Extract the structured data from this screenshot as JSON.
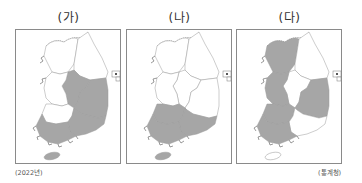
{
  "panels": [
    {
      "title": "(가)",
      "fills": {
        "gyeonggi": "#ffffff",
        "gangwon": "#ffffff",
        "chungbuk": "#a6a6a6",
        "chungnam": "#ffffff",
        "jeonbuk": "#ffffff",
        "jeonnam": "#a6a6a6",
        "gyeongbuk": "#a6a6a6",
        "gyeongnam": "#a6a6a6",
        "jeju": "#a6a6a6"
      }
    },
    {
      "title": "(나)",
      "fills": {
        "gyeonggi": "#ffffff",
        "gangwon": "#ffffff",
        "chungbuk": "#ffffff",
        "chungnam": "#ffffff",
        "jeonbuk": "#a6a6a6",
        "jeonnam": "#a6a6a6",
        "gyeongbuk": "#ffffff",
        "gyeongnam": "#a6a6a6",
        "jeju": "#a6a6a6"
      }
    },
    {
      "title": "(다)",
      "fills": {
        "gyeonggi": "#a6a6a6",
        "gangwon": "#ffffff",
        "chungbuk": "#ffffff",
        "chungnam": "#a6a6a6",
        "jeonbuk": "#a6a6a6",
        "jeonnam": "#a6a6a6",
        "gyeongbuk": "#a6a6a6",
        "gyeongnam": "#ffffff",
        "jeju": "#ffffff"
      }
    }
  ],
  "legend": {
    "shaded_color": "#a6a6a6",
    "unshaded_color": "#ffffff"
  },
  "footer": {
    "year_note": "(2022년)",
    "source": "(통계청)"
  }
}
